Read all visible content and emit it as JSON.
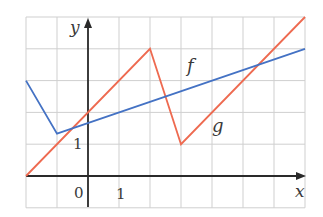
{
  "chart_data": {
    "type": "line",
    "title": "",
    "xlabel": "x",
    "ylabel": "y",
    "xlim": [
      -2,
      7
    ],
    "ylim": [
      -1,
      5
    ],
    "grid": true,
    "grid_step": 1,
    "tick_labels": {
      "x": [
        "0",
        "1"
      ],
      "y": [
        "1"
      ]
    },
    "series": [
      {
        "name": "f",
        "color": "#4472c4",
        "points": [
          [
            -2,
            3
          ],
          [
            -1,
            1.33
          ],
          [
            7,
            4
          ]
        ]
      },
      {
        "name": "g",
        "color": "#ee6a50",
        "points": [
          [
            -2,
            0
          ],
          [
            2,
            4
          ],
          [
            3,
            1
          ],
          [
            7,
            5
          ]
        ]
      }
    ],
    "annotations": [
      {
        "text": "f",
        "x": 3.4,
        "y": 3.5
      },
      {
        "text": "g",
        "x": 4.2,
        "y": 1.4
      }
    ]
  },
  "labels": {
    "x_axis": "x",
    "y_axis": "y",
    "origin": "0",
    "x_tick_1": "1",
    "y_tick_1": "1",
    "f_label": "f",
    "g_label": "g"
  },
  "colors": {
    "f": "#4472c4",
    "g": "#ee6a50",
    "grid": "#cfcfcf",
    "axis": "#2a2a2a"
  }
}
